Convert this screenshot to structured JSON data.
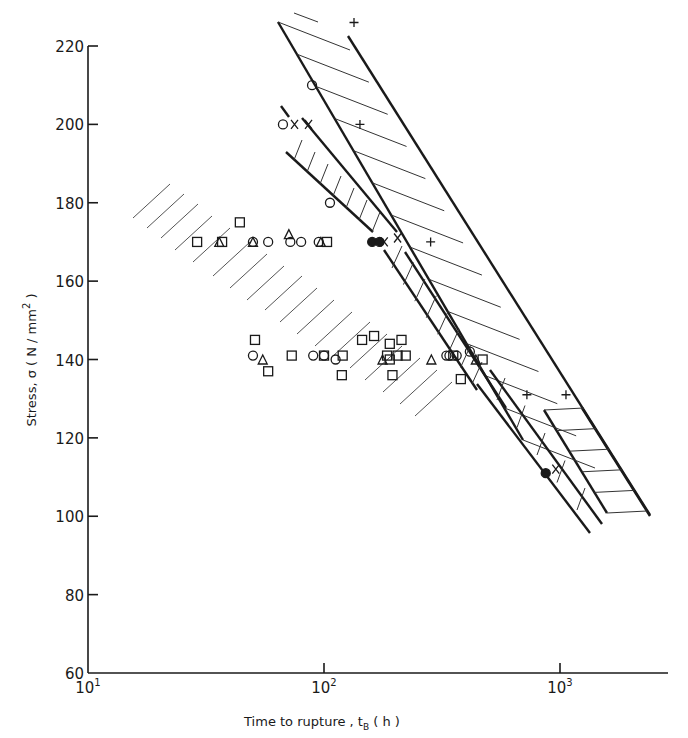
{
  "chart_data": {
    "type": "scatter",
    "title": "",
    "xlabel": "Time to rupture, tB (h)",
    "ylabel": "Stress, σ (N/mm²)",
    "xscale": "log",
    "xlim": [
      10,
      2500
    ],
    "ylim": [
      60,
      220
    ],
    "x_ticks": [
      {
        "value": 10,
        "label": "10",
        "exp": "1"
      },
      {
        "value": 100,
        "label": "10",
        "exp": "2"
      },
      {
        "value": 1000,
        "label": "10",
        "exp": "3"
      }
    ],
    "y_ticks": [
      60,
      80,
      100,
      120,
      140,
      160,
      180,
      200,
      220
    ],
    "grid": false,
    "legend": null,
    "series": [
      {
        "name": "circle",
        "marker": "open-circle",
        "points": [
          [
            67,
            200
          ],
          [
            89,
            210
          ],
          [
            106,
            180
          ],
          [
            50,
            170
          ],
          [
            58,
            170
          ],
          [
            72,
            170
          ],
          [
            80,
            170
          ],
          [
            95,
            170
          ],
          [
            50,
            141
          ],
          [
            90,
            141
          ],
          [
            112,
            140
          ],
          [
            100,
            141
          ],
          [
            330,
            141
          ],
          [
            365,
            141
          ],
          [
            340,
            141
          ],
          [
            415,
            142
          ]
        ]
      },
      {
        "name": "square",
        "marker": "open-square",
        "points": [
          [
            29,
            170
          ],
          [
            37,
            170
          ],
          [
            44,
            175
          ],
          [
            103,
            170
          ],
          [
            51,
            145
          ],
          [
            58,
            137
          ],
          [
            73,
            141
          ],
          [
            100,
            141
          ],
          [
            120,
            141
          ],
          [
            119,
            136
          ],
          [
            145,
            145
          ],
          [
            163,
            146
          ],
          [
            185,
            141
          ],
          [
            190,
            144
          ],
          [
            190,
            140
          ],
          [
            205,
            141
          ],
          [
            222,
            141
          ],
          [
            195,
            136
          ],
          [
            213,
            145
          ],
          [
            353,
            141
          ],
          [
            470,
            140
          ],
          [
            380,
            135
          ]
        ]
      },
      {
        "name": "triangle",
        "marker": "open-triangle",
        "points": [
          [
            36,
            170
          ],
          [
            50,
            170
          ],
          [
            71,
            172
          ],
          [
            97,
            170
          ],
          [
            55,
            140
          ],
          [
            177,
            140
          ],
          [
            285,
            140
          ],
          [
            440,
            140
          ]
        ]
      },
      {
        "name": "cross-x",
        "marker": "x",
        "points": [
          [
            75,
            200
          ],
          [
            86,
            200
          ],
          [
            180,
            170
          ],
          [
            205,
            171
          ],
          [
            960,
            112
          ]
        ]
      },
      {
        "name": "plus",
        "marker": "plus",
        "points": [
          [
            134,
            226
          ],
          [
            142,
            200
          ],
          [
            283,
            170
          ],
          [
            724,
            131
          ],
          [
            1060,
            131
          ]
        ]
      },
      {
        "name": "filled-circle",
        "marker": "filled-circle",
        "points": [
          [
            160,
            170
          ],
          [
            172,
            170
          ],
          [
            870,
            111
          ]
        ]
      }
    ],
    "bands": [
      {
        "name": "wide-band-upper",
        "hatch": "horizontal-diagonal",
        "note": "broad hatched scatter band from ~t 70h σ 225 to ~t 2400h σ 100"
      },
      {
        "name": "narrow-band-middle",
        "hatch": "steep-diagonal",
        "note": "narrow hatched band from ~t 75h σ 205 to ~t 1300h σ 97, broken near σ 170"
      },
      {
        "name": "open-band-lower-left",
        "hatch": "open-diagonal",
        "note": "unbounded hatched region covering 140–170 N/mm² data at t 20–450h"
      }
    ]
  },
  "axes": {
    "y_label_prefix": "Stress, σ ( N / mm",
    "y_label_sup": "2",
    "y_label_suffix": " )",
    "x_label_prefix": "Time to rupture , t",
    "x_label_sub": "B",
    "x_label_suffix": "  ( h )"
  }
}
